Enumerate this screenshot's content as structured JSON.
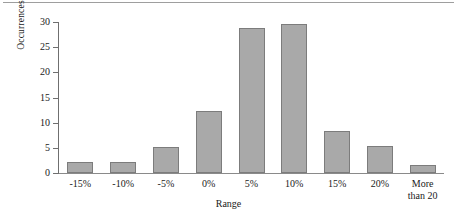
{
  "chart_data": {
    "type": "bar",
    "title": "",
    "xlabel": "Range",
    "ylabel": "Occurrences",
    "categories": [
      "-15%",
      "-10%",
      "-5%",
      "0%",
      "5%",
      "10%",
      "15%",
      "20%",
      "More\nthan 20"
    ],
    "values": [
      2.1,
      2.1,
      5.2,
      12.3,
      28.8,
      29.6,
      8.3,
      5.4,
      1.5
    ],
    "ylim": [
      0,
      30
    ],
    "yticks": [
      0,
      5,
      10,
      15,
      20,
      25,
      30
    ],
    "ytick_labels": [
      "0",
      "5",
      "10",
      "15",
      "20",
      "25",
      "30"
    ],
    "grid": false,
    "legend": false,
    "bar_fill_color": "#a9a9a9",
    "bar_border_color": "#7c7c7c",
    "axis_color": "#6f6f6f"
  }
}
